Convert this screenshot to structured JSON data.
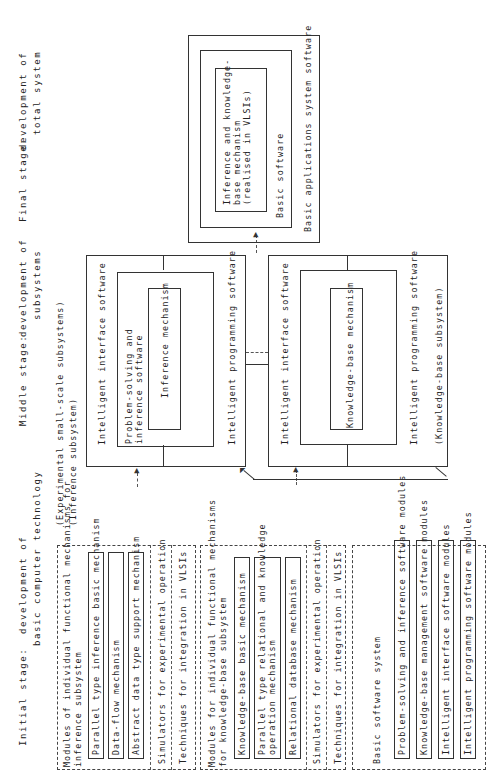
{
  "stages": {
    "initial": {
      "label": "Initial stage:",
      "line1": "development of",
      "line2": "basic computer technology"
    },
    "middle": {
      "label": "Middle stage:",
      "line1": "development of",
      "line2": "subsystems"
    },
    "final": {
      "label": "Final stage:",
      "line1": "development of",
      "line2": "total system"
    }
  },
  "initial_stage": {
    "inference_group": {
      "title_line1": "Modules of individual functional mechanisms for",
      "title_line2": "inference subsystem",
      "items": [
        "Parallel type inference basic mechanism",
        "Data-flow mechanism",
        "Abstract data type support mechanism"
      ],
      "simulators": "Simulators for experimental operation",
      "techniques": "Techniques for integration in VLSIs"
    },
    "kb_group": {
      "title_line1": "Modules for individual functional mechanisms",
      "title_line2": "for knowledge-base subsystem",
      "items": [
        "Knowledge-base basic mechanism",
        "Parallel type relational and knowledge",
        "operation mechanism",
        "Relational database mechanism"
      ],
      "simulators": "Simulators for experimental operation",
      "techniques": "Techniques for integration in VLSIs"
    },
    "software_group": {
      "title": "Basic software system",
      "items": [
        "Problem-solving and inference software modules",
        "Knowledge-base management software modules",
        "Intelligent interface software modules",
        "Intelligent programming software modules"
      ]
    }
  },
  "middle_stage": {
    "heading": "(Experimental small-scale subsystems)",
    "inference_subsystem": {
      "label": "(Inference subsystem)",
      "interface": "Intelligent interface software",
      "ps_line1": "Problem-solving and",
      "ps_line2": "inference software",
      "core": "Inference mechanism",
      "programming": "Intelligent programming software"
    },
    "kb_subsystem": {
      "label": "(Knowledge-base subsystem)",
      "interface": "Intelligent interface software",
      "core": "Knowledge-base mechanism",
      "programming": "Intelligent programming software"
    }
  },
  "final_stage": {
    "core_line1": "Inference and knowledge-",
    "core_line2": "base mechanism",
    "core_line3": "(realised in VLSIs)",
    "basic_software": "Basic software",
    "applications": "Basic applications system software"
  }
}
